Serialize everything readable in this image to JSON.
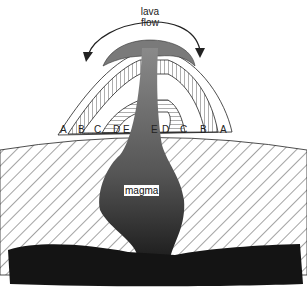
{
  "diagram": {
    "title_label": [
      "lava",
      "flow"
    ],
    "magma_label": "magma",
    "layer_labels_left": [
      "A",
      "B",
      "C",
      "D",
      "E"
    ],
    "layer_labels_right": [
      "E",
      "D",
      "C",
      "B",
      "A"
    ],
    "colors": {
      "magma_dark": "#1a1a1a",
      "conduit_gray": "#6e6e6e",
      "lava_cap_gray": "#8a8a8a",
      "hatch": "#333333",
      "background": "#ffffff"
    }
  }
}
